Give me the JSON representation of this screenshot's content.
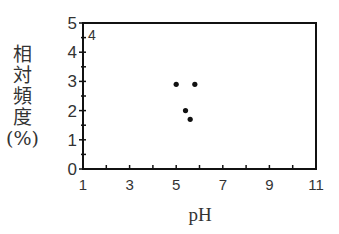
{
  "chart_data": {
    "type": "scatter",
    "title": "",
    "panel_label": "4",
    "xlabel": "pH",
    "ylabel": "相対頻度(%)",
    "ylabel_lines": [
      "相",
      "対",
      "頻",
      "度",
      "(%)"
    ],
    "xlim": [
      1,
      11
    ],
    "ylim": [
      0,
      5
    ],
    "xticks": [
      1,
      3,
      5,
      7,
      9,
      11
    ],
    "yticks": [
      0,
      1,
      2,
      3,
      4,
      5
    ],
    "grid": false,
    "legend": null,
    "series": [
      {
        "name": "points",
        "x": [
          5.0,
          5.8,
          5.4,
          5.6
        ],
        "y": [
          2.9,
          2.9,
          2.0,
          1.7
        ]
      }
    ]
  },
  "colors": {
    "axis": "#111111",
    "marker": "#111111",
    "text": "#333333"
  }
}
